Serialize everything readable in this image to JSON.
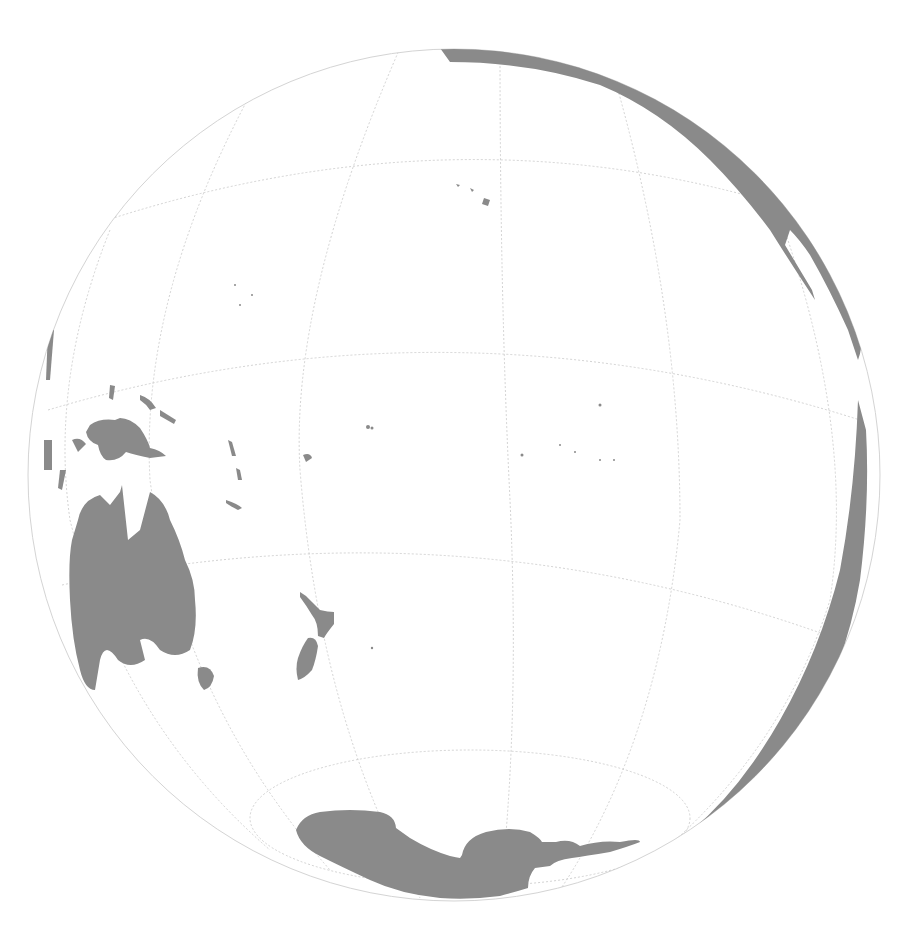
{
  "map": {
    "projection": "orthographic",
    "center_px": [
      454,
      475
    ],
    "radius_px": 426,
    "colors": {
      "background": "#ffffff",
      "ocean": "#ffffff",
      "land": "#8a8a8a",
      "graticule": "#c8c8c8",
      "outline": "#d4d4d4"
    },
    "visible_landmasses": [
      "Australia",
      "New Guinea",
      "New Zealand",
      "Antarctica",
      "North America (west coast)",
      "Baja California",
      "South America (west coast)",
      "Indonesia / Philippines (east edge)",
      "Hawaiian Islands",
      "Solomon Islands",
      "Vanuatu",
      "Fiji",
      "Tasmania",
      "Pacific island groups"
    ],
    "graticule": {
      "visible": true,
      "style": "dotted"
    }
  }
}
